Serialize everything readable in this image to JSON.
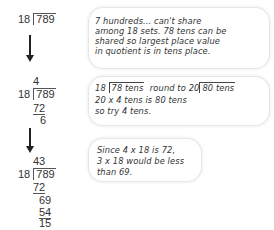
{
  "steps": [
    {
      "divisor": "18",
      "dividend": "789"
    },
    {
      "quotient": "4",
      "divisor": "18",
      "dividend": "789",
      "product": "72",
      "remainder": "6"
    },
    {
      "quotient": "43",
      "divisor": "18",
      "dividend": "789",
      "product1": "72",
      "bring_down": "69",
      "product2": "54",
      "remainder": "15"
    }
  ],
  "notes": [
    {
      "lines": [
        "7 hundreds... can't share",
        "among 18 sets. 78 tens can be",
        "shared so largest place value",
        "in quotient is in tens place."
      ]
    },
    {
      "line1_divisor": "18",
      "line1_dividend": "78 tens",
      "line1_mid": "round to",
      "line1_divisor2": "20",
      "line1_dividend2": "80 tens",
      "lines": [
        "20 x 4 tens is 80 tens",
        "so try 4 tens."
      ]
    },
    {
      "lines": [
        "Since 4 x 18 is 72,",
        "3 x 18 would be less",
        "than 69."
      ]
    }
  ]
}
